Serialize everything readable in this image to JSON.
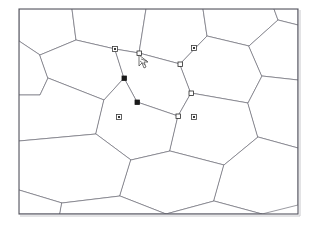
{
  "app": {
    "window_title": "",
    "canvas_background": "#ffffff",
    "edge_color": "#6e6e78",
    "frame_color": "#55555f",
    "handle_fill_selected": "#1a1a1a",
    "handle_fill_unselected": "#ffffff",
    "handle_stroke": "#2a2a2a",
    "cursor_color": "#3a3a3a"
  },
  "canvas": {
    "width": 315,
    "height": 227,
    "frame": {
      "x": 19,
      "y": 9,
      "width": 279,
      "height": 205
    }
  },
  "drawing": {
    "type": "hexagonal-tessellation",
    "description": "Honeycomb grid of irregular hexagonal cells, rows sheared diagonally",
    "cell_count": 20,
    "cells": [
      {
        "id": "cell-r0-c0",
        "points": "19,9 19,41 40,55 76,40 72,9"
      },
      {
        "id": "cell-r0-c1",
        "points": "72,9 76,40 115,49 139,53 146,9"
      },
      {
        "id": "cell-r0-c2",
        "points": "146,9 139,53 180,64 207,36 203,9"
      },
      {
        "id": "cell-r0-c3",
        "points": "203,9 207,36 249,46 278,20 274,9"
      },
      {
        "id": "cell-r0-c4",
        "points": "274,9 278,20 298,25 298,9"
      },
      {
        "id": "cell-r1-c0",
        "points": "19,41 40,55 48,78 40,95 19,95"
      },
      {
        "id": "cell-r1-c1",
        "points": "40,55 76,40 115,49 124,78 104,100 48,78"
      },
      {
        "id": "cell-r1-c2",
        "points": "115,49 139,53 180,64 191,93 178,116 137,102 124,78"
      },
      {
        "id": "cell-r1-c3",
        "points": "180,64 207,36 249,46 262,76 248,103 191,93"
      },
      {
        "id": "cell-r1-c4",
        "points": "249,46 278,20 298,25 298,80 262,76"
      },
      {
        "id": "cell-r2-c0",
        "points": "19,95 40,95 48,78 104,100 96,134 19,141"
      },
      {
        "id": "cell-r2-c1",
        "points": "104,100 124,78 137,102 178,116 170,151 131,160 96,134"
      },
      {
        "id": "cell-r2-c2",
        "points": "178,116 191,93 248,103 258,137 224,165 170,151"
      },
      {
        "id": "cell-r2-c3",
        "points": "248,103 262,76 298,80 298,148 258,137"
      },
      {
        "id": "cell-r3-c0",
        "points": "19,141 96,134 131,160 120,196 62,203 19,190"
      },
      {
        "id": "cell-r3-c1",
        "points": "131,160 170,151 224,165 214,201 166,214 120,196"
      },
      {
        "id": "cell-r3-c2",
        "points": "224,165 258,137 298,148 298,205 262,214 214,201"
      },
      {
        "id": "cell-r4-c0",
        "points": "19,190 62,203 60,214 19,214"
      },
      {
        "id": "cell-r4-c1",
        "points": "62,203 120,196 166,214 60,214"
      },
      {
        "id": "cell-r4-c2",
        "points": "166,214 214,201 262,214"
      }
    ]
  },
  "selection": {
    "selected_shape_id": "cell-r1-c2",
    "handle_size": 4,
    "handles": [
      {
        "name": "handle-vertex-nw",
        "x": 139,
        "y": 53,
        "state": "hover",
        "style": "hollow"
      },
      {
        "name": "handle-vertex-ne",
        "x": 180,
        "y": 64,
        "state": "normal",
        "style": "hollow"
      },
      {
        "name": "handle-vertex-e",
        "x": 191,
        "y": 93,
        "state": "normal",
        "style": "hollow"
      },
      {
        "name": "handle-vertex-se",
        "x": 178,
        "y": 116,
        "state": "normal",
        "style": "hollow"
      },
      {
        "name": "handle-vertex-sw",
        "x": 137,
        "y": 102,
        "state": "selected",
        "style": "filled"
      },
      {
        "name": "handle-vertex-w",
        "x": 124,
        "y": 78,
        "state": "selected",
        "style": "filled"
      }
    ]
  },
  "anchors": [
    {
      "name": "anchor-point-1",
      "x": 115,
      "y": 49
    },
    {
      "name": "anchor-point-2",
      "x": 194,
      "y": 48
    },
    {
      "name": "anchor-point-3",
      "x": 119,
      "y": 117
    },
    {
      "name": "anchor-point-4",
      "x": 194,
      "y": 117
    }
  ],
  "pointer": {
    "name": "mouse-cursor",
    "x": 139,
    "y": 55,
    "shape": "arrow-with-marquee",
    "label": ""
  }
}
